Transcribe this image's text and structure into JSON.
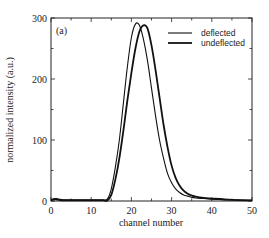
{
  "chart_data": {
    "type": "line",
    "title": "",
    "panel_label": "(a)",
    "xlabel": "channel number",
    "ylabel": "normalized intensity (a.u.)",
    "xlim": [
      0,
      50
    ],
    "ylim": [
      0,
      300
    ],
    "x_ticks": [
      0,
      10,
      20,
      30,
      40,
      50
    ],
    "y_ticks": [
      0,
      100,
      200,
      300
    ],
    "x_minor_step": 5,
    "y_minor_step": 50,
    "grid": false,
    "legend_position": "upper right",
    "series": [
      {
        "name": "deflected",
        "color": "#111111",
        "width": 1.1,
        "x": [
          0,
          1,
          2,
          3,
          5,
          8,
          10,
          12,
          13,
          14,
          15,
          16,
          17,
          18,
          19,
          20,
          21,
          22,
          23,
          24,
          25,
          26,
          27,
          28,
          29,
          30,
          31,
          32,
          33,
          34,
          35,
          36,
          38,
          40,
          45,
          50
        ],
        "y": [
          2,
          4,
          3,
          2,
          2,
          2,
          2,
          2,
          2,
          3,
          20,
          55,
          100,
          160,
          220,
          268,
          290,
          288,
          265,
          230,
          185,
          140,
          100,
          70,
          45,
          30,
          20,
          14,
          10,
          8,
          6,
          5,
          4,
          3,
          2,
          1
        ]
      },
      {
        "name": "undeflected",
        "color": "#111111",
        "width": 1.8,
        "x": [
          0,
          1,
          2,
          3,
          5,
          8,
          10,
          12,
          13,
          14,
          15,
          16,
          17,
          18,
          19,
          20,
          21,
          22,
          23,
          24,
          25,
          26,
          27,
          28,
          29,
          30,
          31,
          32,
          33,
          34,
          35,
          36,
          38,
          40,
          45,
          50
        ],
        "y": [
          1,
          3,
          2,
          1,
          1,
          1,
          1,
          1,
          1,
          1,
          10,
          35,
          70,
          115,
          165,
          210,
          250,
          278,
          288,
          283,
          255,
          215,
          170,
          125,
          88,
          58,
          38,
          25,
          17,
          12,
          9,
          7,
          5,
          4,
          2,
          1
        ]
      }
    ]
  }
}
